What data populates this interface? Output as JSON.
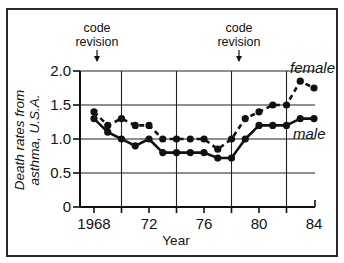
{
  "chart_data": {
    "type": "line",
    "title": "",
    "xlabel": "Year",
    "ylabel": "Death rates from asthma, U.S.A.",
    "ylabel_lines": [
      "Death rates from",
      "asthma, U.S.A."
    ],
    "x": [
      1968,
      1969,
      1970,
      1971,
      1972,
      1973,
      1974,
      1975,
      1976,
      1977,
      1978,
      1979,
      1980,
      1981,
      1982,
      1983,
      1984
    ],
    "series": [
      {
        "name": "female",
        "style": "dashed",
        "values": [
          1.4,
          1.2,
          1.3,
          1.2,
          1.2,
          1.0,
          1.0,
          1.0,
          1.0,
          0.85,
          1.0,
          1.3,
          1.4,
          1.5,
          1.5,
          1.85,
          1.75
        ]
      },
      {
        "name": "male",
        "style": "solid",
        "values": [
          1.3,
          1.1,
          1.0,
          0.9,
          1.0,
          0.8,
          0.8,
          0.8,
          0.8,
          0.72,
          0.72,
          1.0,
          1.2,
          1.2,
          1.2,
          1.3,
          1.3
        ]
      }
    ],
    "x_ticks": [
      1968,
      1972,
      1976,
      1980,
      1984
    ],
    "x_tick_labels": [
      "1968",
      "72",
      "76",
      "80",
      "84"
    ],
    "y_ticks": [
      0,
      0.5,
      1.0,
      1.5,
      2.0
    ],
    "y_tick_labels": [
      "0",
      "0.5",
      "1.0",
      "1.5",
      "2.0"
    ],
    "xlim": [
      1967,
      1984
    ],
    "ylim": [
      0,
      2.0
    ],
    "grid": true,
    "vertical_gridlines": [
      1970,
      1974,
      1978,
      1982
    ],
    "legend": "inline labels at right end of lines",
    "annotations": [
      {
        "text_lines": [
          "code",
          "revision"
        ],
        "arrow": "down",
        "x": 1968
      },
      {
        "text_lines": [
          "code",
          "revision"
        ],
        "arrow": "down",
        "x": 1979
      }
    ]
  },
  "labels": {
    "annotation_1_line1": "code",
    "annotation_1_line2": "revision",
    "annotation_2_line1": "code",
    "annotation_2_line2": "revision",
    "female": "female",
    "male": "male",
    "xlabel": "Year",
    "ylabel_line1": "Death rates from",
    "ylabel_line2": "asthma, U.S.A.",
    "arrow_glyph": "↓"
  }
}
